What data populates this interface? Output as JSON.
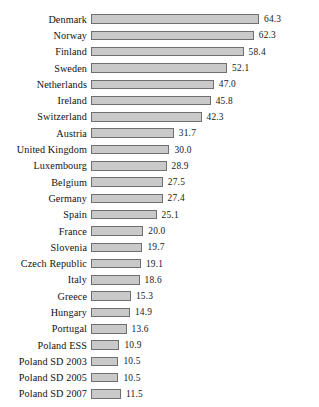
{
  "chart_data": {
    "type": "bar",
    "orientation": "horizontal",
    "title": "",
    "subtitle": "",
    "xlabel": "",
    "ylabel": "",
    "xlim": [
      0,
      64.3
    ],
    "grid": false,
    "legend": null,
    "value_labels": true,
    "bar_color": "#c9c9c9",
    "bar_border_color": "#6f6f6f",
    "background": "#ffffff",
    "categories": [
      "Denmark",
      "Norway",
      "Finland",
      "Sweden",
      "Netherlands",
      "Ireland",
      "Switzerland",
      "Austria",
      "United Kingdom",
      "Luxembourg",
      "Belgium",
      "Germany",
      "Spain",
      "France",
      "Slovenia",
      "Czech Republic",
      "Italy",
      "Greece",
      "Hungary",
      "Portugal",
      "Poland ESS",
      "Poland SD 2003",
      "Poland SD 2005",
      "Poland SD 2007"
    ],
    "values": [
      64.3,
      62.3,
      58.4,
      52.1,
      47.0,
      45.8,
      42.3,
      31.7,
      30.0,
      28.9,
      27.5,
      27.4,
      25.1,
      20.0,
      19.7,
      19.1,
      18.6,
      15.3,
      14.9,
      13.6,
      10.9,
      10.5,
      10.5,
      11.5
    ],
    "value_text": [
      "64.3",
      "62.3",
      "58.4",
      "52.1",
      "47.0",
      "45.8",
      "42.3",
      "31.7",
      "30.0",
      "28.9",
      "27.5",
      "27.4",
      "25.1",
      "20.0",
      "19.7",
      "19.1",
      "18.6",
      "15.3",
      "14.9",
      "13.6",
      "10.9",
      "10.5",
      "10.5",
      "11.5"
    ]
  }
}
